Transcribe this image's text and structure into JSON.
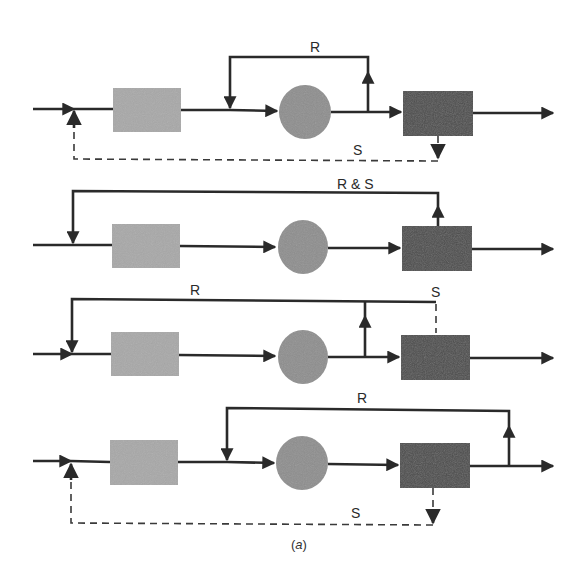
{
  "figure": {
    "caption_open": "(",
    "caption_letter": "a",
    "caption_close": ")",
    "colors": {
      "line": "#2a2a2a",
      "box_light": "#a8a8a8",
      "circle": "#8e8e8e",
      "box_dark": "#4e4e4e"
    }
  },
  "diagrams": [
    {
      "id": "config-1",
      "main_y": 110,
      "light_box": {
        "x": 113,
        "y": 88,
        "w": 68,
        "h": 44
      },
      "circle": {
        "cx": 305,
        "cy": 112,
        "rx": 26,
        "ry": 27
      },
      "dark_box": {
        "x": 403,
        "y": 91,
        "w": 70,
        "h": 45
      },
      "labels": {
        "recycle": "R",
        "split": "S"
      }
    },
    {
      "id": "config-2",
      "main_y": 246,
      "light_box": {
        "x": 112,
        "y": 224,
        "w": 68,
        "h": 44
      },
      "circle": {
        "cx": 303,
        "cy": 247,
        "rx": 25,
        "ry": 27
      },
      "dark_box": {
        "x": 402,
        "y": 226,
        "w": 70,
        "h": 45
      },
      "labels": {
        "recycle_and_split": "R & S"
      }
    },
    {
      "id": "config-3",
      "main_y": 355,
      "light_box": {
        "x": 111,
        "y": 332,
        "w": 68,
        "h": 44
      },
      "circle": {
        "cx": 303,
        "cy": 357,
        "rx": 25,
        "ry": 27
      },
      "dark_box": {
        "x": 401,
        "y": 335,
        "w": 69,
        "h": 45
      },
      "labels": {
        "recycle": "R",
        "split": "S"
      }
    },
    {
      "id": "config-4",
      "main_y": 463,
      "light_box": {
        "x": 110,
        "y": 440,
        "w": 68,
        "h": 45
      },
      "circle": {
        "cx": 302,
        "cy": 463,
        "rx": 26,
        "ry": 27
      },
      "dark_box": {
        "x": 400,
        "y": 443,
        "w": 70,
        "h": 45
      },
      "labels": {
        "recycle": "R",
        "split": "S"
      }
    }
  ]
}
